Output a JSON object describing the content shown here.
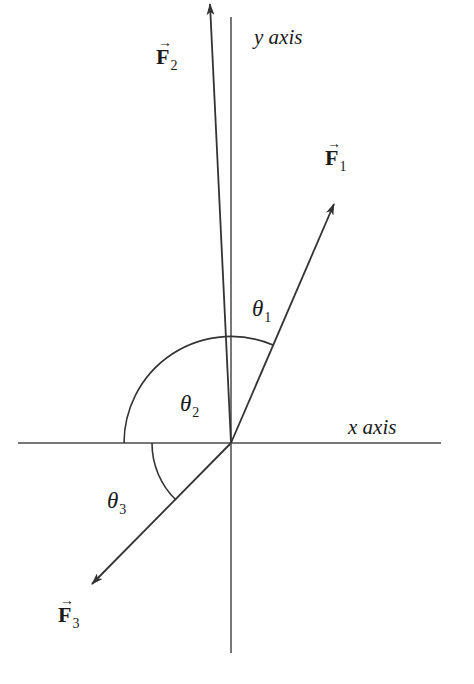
{
  "figure": {
    "axes": {
      "x_label": "x axis",
      "y_label": "y axis"
    },
    "vectors": [
      {
        "name": "F",
        "subscript": "1",
        "arrow": "→"
      },
      {
        "name": "F",
        "subscript": "2",
        "arrow": "→"
      },
      {
        "name": "F",
        "subscript": "3",
        "arrow": "→"
      }
    ],
    "angles": [
      {
        "symbol": "θ",
        "subscript": "1"
      },
      {
        "symbol": "θ",
        "subscript": "2"
      },
      {
        "symbol": "θ",
        "subscript": "3"
      }
    ],
    "colors": {
      "axis": "#777777",
      "vector": "#333333",
      "arc": "#333333"
    }
  }
}
